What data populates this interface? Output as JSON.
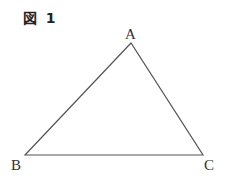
{
  "figure": {
    "title": "図 1"
  },
  "triangle": {
    "stroke_color": "#555555",
    "vertices": [
      {
        "label": "A",
        "x": 131,
        "y": 43
      },
      {
        "label": "B",
        "x": 25,
        "y": 155
      },
      {
        "label": "C",
        "x": 203,
        "y": 155
      }
    ]
  }
}
